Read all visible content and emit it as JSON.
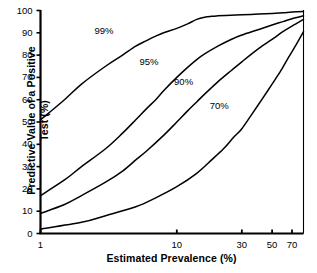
{
  "chart_data": {
    "type": "line",
    "title": "",
    "xlabel": "Estimated Prevalence (%)",
    "ylabel_line1": "Predictive Value of a Positive",
    "ylabel_line2": "Test (%)",
    "xscale": "log",
    "xlim": [
      1,
      85
    ],
    "ylim": [
      0,
      100
    ],
    "grid": false,
    "legend_position": "inline-curve-labels",
    "xticks": [
      {
        "value": 1,
        "label": "1"
      },
      {
        "value": 10,
        "label": "10"
      },
      {
        "value": 30,
        "label": "30"
      },
      {
        "value": 50,
        "label": "50"
      },
      {
        "value": 70,
        "label": "70"
      }
    ],
    "yticks": [
      {
        "value": 0,
        "label": "0"
      },
      {
        "value": 10,
        "label": "10"
      },
      {
        "value": 20,
        "label": "20"
      },
      {
        "value": 30,
        "label": "30"
      },
      {
        "value": 40,
        "label": "40"
      },
      {
        "value": 50,
        "label": "50"
      },
      {
        "value": 60,
        "label": "60"
      },
      {
        "value": 70,
        "label": "70"
      },
      {
        "value": 80,
        "label": "80"
      },
      {
        "value": 90,
        "label": "90"
      },
      {
        "value": 100,
        "label": "100"
      }
    ],
    "series": [
      {
        "name": "99%",
        "annotation": "99%",
        "annotation_x": 3.0,
        "annotation_y": 91,
        "x": [
          1,
          1.5,
          2,
          3,
          4,
          5,
          6,
          7,
          8,
          10,
          12,
          14,
          16,
          18,
          20,
          25,
          30,
          40,
          50,
          60,
          70,
          85
        ],
        "y": [
          51,
          60,
          67,
          75,
          80,
          84,
          86.5,
          88.5,
          90,
          92,
          94,
          96,
          97,
          97.4,
          97.6,
          97.9,
          98.1,
          98.4,
          98.7,
          99,
          99.3,
          99.6
        ]
      },
      {
        "name": "95%",
        "annotation": "95%",
        "annotation_x": 6.4,
        "annotation_y": 77,
        "x": [
          1,
          1.5,
          2,
          3,
          4,
          5,
          6,
          7,
          8,
          10,
          12,
          14,
          16,
          20,
          25,
          30,
          40,
          50,
          60,
          70,
          85
        ],
        "y": [
          17,
          24,
          30,
          38,
          45,
          51,
          56,
          60,
          64,
          70,
          74.5,
          78,
          80.5,
          84,
          87,
          89,
          91.5,
          93.5,
          95,
          96.3,
          97.6
        ]
      },
      {
        "name": "90%",
        "annotation": "90%",
        "annotation_x": 11.5,
        "annotation_y": 68,
        "x": [
          1,
          1.5,
          2,
          3,
          4,
          5,
          6,
          8,
          10,
          12,
          14,
          16,
          20,
          25,
          30,
          40,
          50,
          60,
          70,
          85
        ],
        "y": [
          9,
          13,
          17,
          23,
          28,
          33,
          37,
          44,
          50,
          55,
          59,
          62.5,
          68,
          73,
          77,
          83,
          87,
          90.5,
          93,
          96
        ]
      },
      {
        "name": "70%",
        "annotation": "70%",
        "annotation_x": 21,
        "annotation_y": 57,
        "x": [
          1,
          2,
          3,
          5,
          7,
          10,
          14,
          18,
          22,
          26,
          30,
          36,
          42,
          50,
          58,
          66,
          74,
          85
        ],
        "y": [
          2,
          5,
          8,
          12,
          16,
          21,
          27,
          33,
          38,
          43,
          47,
          54,
          60,
          67,
          73,
          79,
          84,
          90.5
        ]
      }
    ]
  },
  "axes": {
    "x_title": "Estimated Prevalence (%)",
    "y_title_line1": "Predictive Value of a Positive",
    "y_title_line2": "Test (%)"
  },
  "style": {
    "line_color": "#000000",
    "axis_color": "#000000",
    "background": "#ffffff"
  }
}
